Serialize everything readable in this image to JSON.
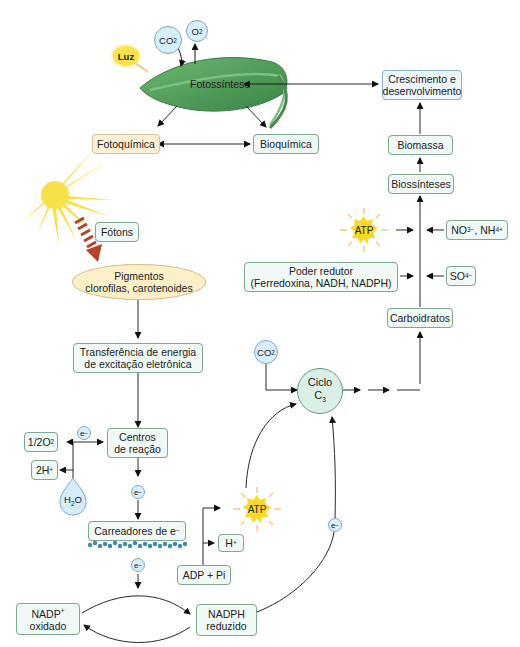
{
  "diagram": {
    "leaf": {
      "label": "Fotossíntese",
      "inputs": {
        "co2": "CO2",
        "o2": "O2",
        "light": "Luz"
      }
    },
    "top": {
      "fotoquimica": "Fotoquímica",
      "bioquimica": "Bioquímica",
      "crescimento_line1": "Crescimento e",
      "crescimento_line2": "desenvolvimento",
      "biomassa": "Biomassa",
      "biossinteses": "Biossínteses"
    },
    "inputs_right": {
      "atp": "ATP",
      "nitrogen": "NO3−, NH4+",
      "sulfate": "SO4−",
      "poder_line1": "Poder redutor",
      "poder_line2": "(Ferredoxina, NADH, NADPH)",
      "carboidratos": "Carboidratos"
    },
    "light_chain": {
      "fotons": "Fótons",
      "pigmentos_line1": "Pigmentos",
      "pigmentos_line2": "clorofilas, carotenoides",
      "transferencia_line1": "Transferência de energia",
      "transferencia_line2": "de excitação eletrônica",
      "centros_line1": "Centros",
      "centros_line2": "de reação",
      "electron": "e−",
      "half_o2": "1/2O2",
      "two_h": "2H+",
      "water": "H2O",
      "carreadores": "Carreadores de e−"
    },
    "calvin": {
      "co2": "CO2",
      "ciclo_line1": "Ciclo",
      "ciclo_line2": "C3",
      "atp": "ATP",
      "h_plus": "H+",
      "adp": "ADP + Pi",
      "electron": "e−"
    },
    "nadp": {
      "nadp_line1": "NADP+",
      "nadp_line2": "oxidado",
      "nadph_line1": "NADPH",
      "nadph_line2": "reduzido"
    },
    "colors": {
      "box_border": "#7fa890",
      "box_fill": "#f1f9f6",
      "circle_fill": "#d8eefa",
      "sun_yellow": "#fbe34a",
      "photon_arrow": "#b5432b",
      "leaf_green": "#4f9a5a"
    }
  }
}
